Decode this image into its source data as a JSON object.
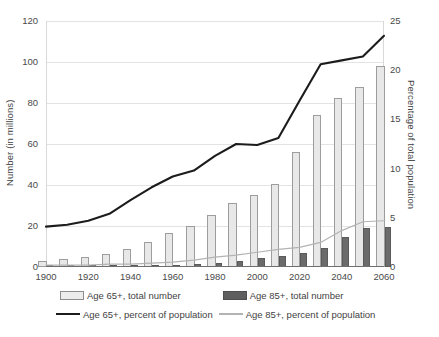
{
  "chart_data": {
    "type": "bar",
    "title": "",
    "subtitle": "",
    "xlabel": "",
    "ylabel": "Number (in millions)",
    "y2label": "Percentage of total population",
    "xlim": [
      1900,
      2060
    ],
    "ylim": [
      0,
      120
    ],
    "y2lim": [
      0,
      25
    ],
    "grid": true,
    "legend_position": "bottom",
    "x_ticks": [
      "1900",
      "1920",
      "1940",
      "1960",
      "1980",
      "2000",
      "2020",
      "2040",
      "2060"
    ],
    "y_ticks_left": [
      "0",
      "20",
      "40",
      "60",
      "80",
      "100",
      "120"
    ],
    "y_ticks_right": [
      "0",
      "5",
      "10",
      "15",
      "20",
      "25"
    ],
    "x": [
      1900,
      1910,
      1920,
      1930,
      1940,
      1950,
      1960,
      1970,
      1980,
      1990,
      2000,
      2010,
      2020,
      2030,
      2040,
      2050,
      2060
    ],
    "series": [
      {
        "name": "Age 65+, total number",
        "type": "bar",
        "axis": "left",
        "unit": "millions",
        "color": "#e8e8e8",
        "values": [
          3.1,
          3.9,
          4.9,
          6.6,
          9.0,
          12.3,
          16.6,
          20.1,
          25.5,
          31.2,
          35.0,
          40.3,
          56.1,
          74.1,
          82.3,
          88.0,
          98.2
        ]
      },
      {
        "name": "Age 85+, total number",
        "type": "bar",
        "axis": "left",
        "unit": "millions",
        "color": "#6b6b6b",
        "values": [
          0.1,
          0.2,
          0.2,
          0.3,
          0.4,
          0.6,
          0.9,
          1.4,
          2.2,
          3.0,
          4.2,
          5.5,
          6.7,
          9.1,
          14.6,
          19.0,
          19.7
        ]
      },
      {
        "name": "Age 65+, percent of population",
        "type": "line",
        "axis": "right",
        "unit": "percent",
        "color": "#1c1c1c",
        "values": [
          4.1,
          4.3,
          4.7,
          5.4,
          6.8,
          8.1,
          9.2,
          9.8,
          11.3,
          12.5,
          12.4,
          13.1,
          16.9,
          20.6,
          21.0,
          21.4,
          23.5
        ]
      },
      {
        "name": "Age 85+, percent of population",
        "type": "line",
        "axis": "right",
        "unit": "percent",
        "color": "#b3b3b3",
        "values": [
          0.2,
          0.2,
          0.2,
          0.3,
          0.3,
          0.4,
          0.5,
          0.7,
          1.0,
          1.2,
          1.5,
          1.8,
          2.0,
          2.5,
          3.7,
          4.6,
          4.7
        ]
      }
    ]
  },
  "axes": {
    "left_title": "Number (in millions)",
    "right_title": "Percentage of total population"
  },
  "legend": {
    "items": [
      {
        "label": "Age 65+, total number",
        "marker": "bar-light-swatch"
      },
      {
        "label": "Age 85+, total number",
        "marker": "bar-dark-swatch"
      },
      {
        "label": "Age 65+, percent of population",
        "marker": "line-dark-swatch"
      },
      {
        "label": "Age 85+, percent of population",
        "marker": "line-light-swatch"
      }
    ]
  }
}
